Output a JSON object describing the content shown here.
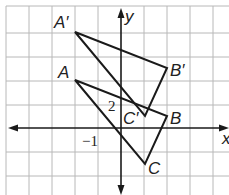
{
  "diagram": {
    "type": "coordinate-plane-transformation",
    "axes": {
      "x_label": "x",
      "y_label": "y"
    },
    "tick_labels": [
      {
        "text": "2",
        "axis": "y",
        "value": 1
      },
      {
        "text": "−1",
        "axis": "x",
        "value": -1
      }
    ],
    "triangles": [
      {
        "name": "ABC",
        "vertices": [
          {
            "label": "A",
            "x": -2,
            "y": 2
          },
          {
            "label": "B",
            "x": 2,
            "y": 0.5
          },
          {
            "label": "C",
            "x": 1,
            "y": -1.5
          }
        ]
      },
      {
        "name": "A'B'C'",
        "vertices": [
          {
            "label": "A′",
            "x": -2,
            "y": 4
          },
          {
            "label": "B′",
            "x": 2,
            "y": 2.5
          },
          {
            "label": "C′",
            "x": 1,
            "y": 0.5
          }
        ]
      }
    ],
    "colors": {
      "grid": "#b5b5b5",
      "lines": "#1a1a1a",
      "background": "#ffffff"
    }
  },
  "labels": {
    "A": "A",
    "B": "B",
    "C": "C",
    "A_prime": "A′",
    "B_prime": "B′",
    "C_prime": "C′",
    "x_axis": "x",
    "y_axis": "y",
    "tick_y": "2",
    "tick_x": "−1"
  }
}
